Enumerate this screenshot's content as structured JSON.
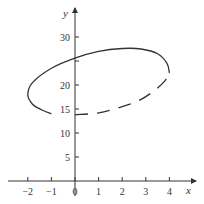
{
  "chart_data": {
    "type": "line",
    "title": "",
    "xlabel": "x",
    "ylabel": "y",
    "x_ticks": [
      -2,
      -1,
      0,
      1,
      2,
      3,
      4
    ],
    "x_tick_labels": [
      "−2",
      "−1",
      "0",
      "1",
      "2",
      "3",
      "4"
    ],
    "y_ticks": [
      5,
      10,
      15,
      20,
      25,
      30
    ],
    "y_tick_labels": [
      "5",
      "10",
      "15",
      "20",
      "",
      "30"
    ],
    "xlim": [
      -3,
      5
    ],
    "ylim": [
      0,
      33
    ],
    "grid": false,
    "legend": null,
    "series": [
      {
        "name": "closed curve (solid part)",
        "style": "solid",
        "points": [
          [
            4.0,
            22.5
          ],
          [
            3.9,
            24.5
          ],
          [
            3.5,
            26.5
          ],
          [
            2.8,
            27.5
          ],
          [
            2.0,
            27.6
          ],
          [
            1.0,
            27.0
          ],
          [
            0.0,
            25.6
          ],
          [
            -1.0,
            23.5
          ],
          [
            -1.8,
            20.5
          ],
          [
            -2.0,
            18.0
          ],
          [
            -1.8,
            16.0
          ],
          [
            -1.4,
            14.8
          ],
          [
            -1.0,
            14.0
          ]
        ]
      },
      {
        "name": "closed curve (dashed part)",
        "style": "dashed",
        "points": [
          [
            0.0,
            13.8
          ],
          [
            1.0,
            14.2
          ],
          [
            2.0,
            15.5
          ],
          [
            2.8,
            17.0
          ],
          [
            3.4,
            19.0
          ],
          [
            3.8,
            20.8
          ],
          [
            4.0,
            22.5
          ]
        ]
      }
    ]
  },
  "axes": {
    "x_label": "x",
    "y_label": "y"
  }
}
